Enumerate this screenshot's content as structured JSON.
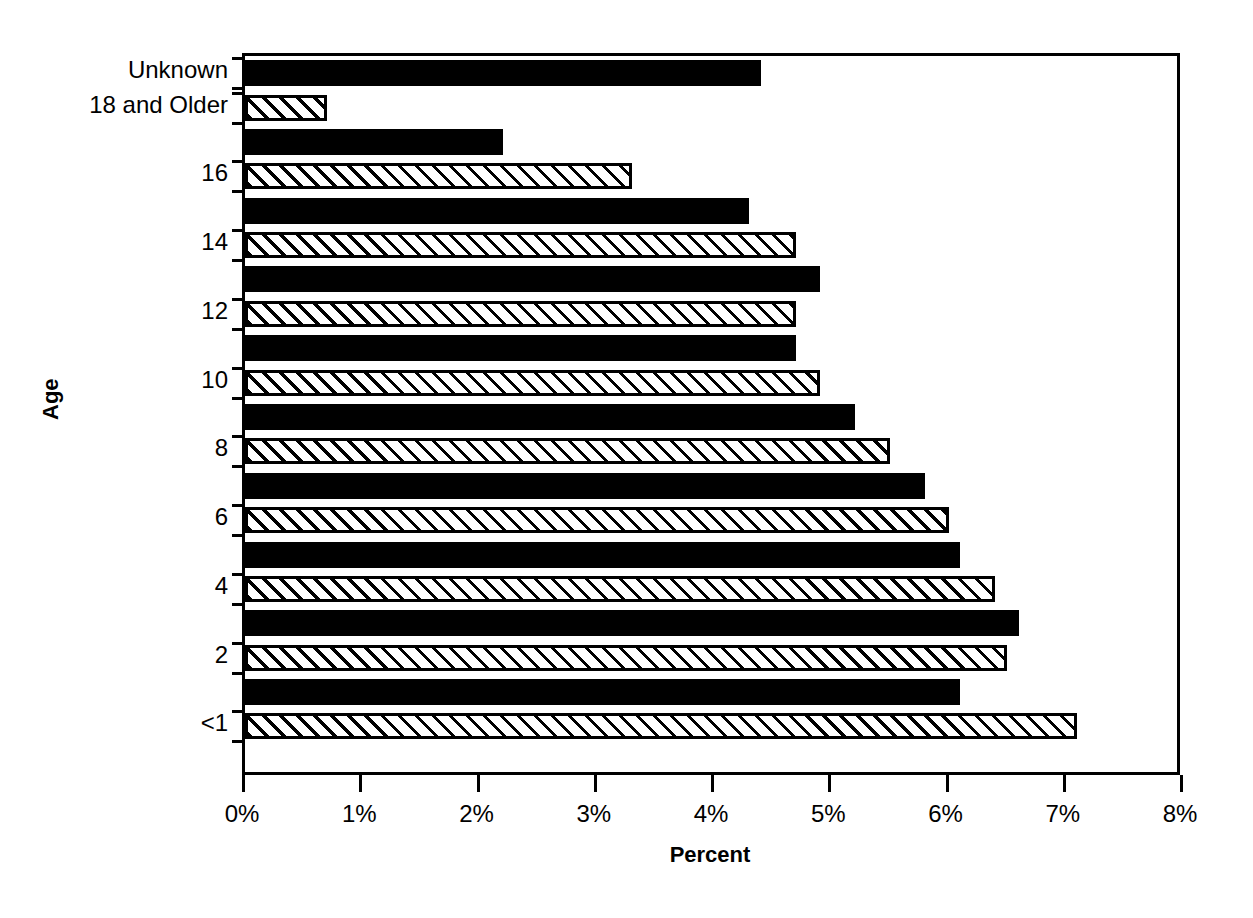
{
  "chart_data": {
    "type": "bar",
    "orientation": "horizontal",
    "title": "",
    "xlabel": "Percent",
    "ylabel": "Age",
    "xlim": [
      0,
      8
    ],
    "xticks": [
      "0%",
      "1%",
      "2%",
      "3%",
      "4%",
      "5%",
      "6%",
      "7%",
      "8%"
    ],
    "xtick_values": [
      0,
      1,
      2,
      3,
      4,
      5,
      6,
      7,
      8
    ],
    "grid": false,
    "legend": null,
    "categories": [
      "<1",
      "1",
      "2",
      "3",
      "4",
      "5",
      "6",
      "7",
      "8",
      "9",
      "10",
      "11",
      "12",
      "13",
      "14",
      "15",
      "16",
      "17",
      "18 and Older",
      "Unknown"
    ],
    "values": [
      7.1,
      6.1,
      6.5,
      6.6,
      6.4,
      6.1,
      6.0,
      5.8,
      5.5,
      5.2,
      4.9,
      4.7,
      4.7,
      4.9,
      4.7,
      4.3,
      3.3,
      2.2,
      0.7,
      4.4
    ],
    "visible_ytick_labels": [
      "<1",
      "2",
      "4",
      "6",
      "8",
      "10",
      "12",
      "14",
      "16",
      "18 and Older",
      "Unknown"
    ],
    "bar_fills": [
      "hatched",
      "solid",
      "hatched",
      "solid",
      "hatched",
      "solid",
      "hatched",
      "solid",
      "hatched",
      "solid",
      "hatched",
      "solid",
      "hatched",
      "solid",
      "hatched",
      "solid",
      "hatched",
      "solid",
      "hatched",
      "solid"
    ],
    "colors": {
      "solid": "#000000",
      "hatch_line": "#000000",
      "hatch_background": "#ffffff",
      "axis": "#000000",
      "background": "#ffffff"
    }
  },
  "rows": [
    {
      "label": "Unknown",
      "value": 4.4,
      "fill": "solid",
      "labeled": true
    },
    {
      "label": "18 and Older",
      "value": 0.7,
      "fill": "hatched",
      "labeled": true
    },
    {
      "label": "17",
      "value": 2.2,
      "fill": "solid",
      "labeled": false
    },
    {
      "label": "16",
      "value": 3.3,
      "fill": "hatched",
      "labeled": true
    },
    {
      "label": "15",
      "value": 4.3,
      "fill": "solid",
      "labeled": false
    },
    {
      "label": "14",
      "value": 4.7,
      "fill": "hatched",
      "labeled": true
    },
    {
      "label": "13",
      "value": 4.9,
      "fill": "solid",
      "labeled": false
    },
    {
      "label": "12",
      "value": 4.7,
      "fill": "hatched",
      "labeled": true
    },
    {
      "label": "11",
      "value": 4.7,
      "fill": "solid",
      "labeled": false
    },
    {
      "label": "10",
      "value": 4.9,
      "fill": "hatched",
      "labeled": true
    },
    {
      "label": "9",
      "value": 5.2,
      "fill": "solid",
      "labeled": false
    },
    {
      "label": "8",
      "value": 5.5,
      "fill": "hatched",
      "labeled": true
    },
    {
      "label": "7",
      "value": 5.8,
      "fill": "solid",
      "labeled": false
    },
    {
      "label": "6",
      "value": 6.0,
      "fill": "hatched",
      "labeled": true
    },
    {
      "label": "5",
      "value": 6.1,
      "fill": "solid",
      "labeled": false
    },
    {
      "label": "4",
      "value": 6.4,
      "fill": "hatched",
      "labeled": true
    },
    {
      "label": "3",
      "value": 6.6,
      "fill": "solid",
      "labeled": false
    },
    {
      "label": "2",
      "value": 6.5,
      "fill": "hatched",
      "labeled": true
    },
    {
      "label": "1",
      "value": 6.1,
      "fill": "solid",
      "labeled": false
    },
    {
      "label": "<1",
      "value": 7.1,
      "fill": "hatched",
      "labeled": true
    }
  ],
  "axes": {
    "x_title": "Percent",
    "y_title": "Age",
    "x_ticks": [
      "0%",
      "1%",
      "2%",
      "3%",
      "4%",
      "5%",
      "6%",
      "7%",
      "8%"
    ]
  }
}
